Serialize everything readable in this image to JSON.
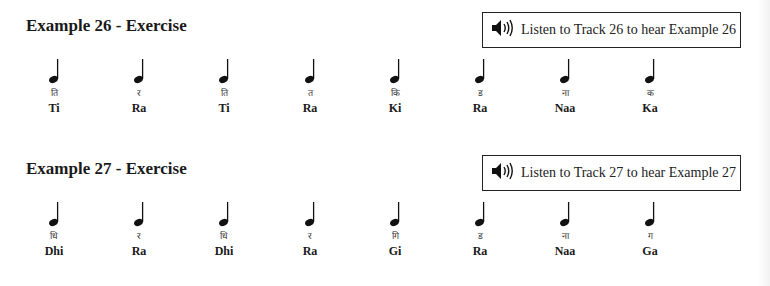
{
  "examples": [
    {
      "title": "Example 26 - Exercise",
      "track_text": "Listen to Track 26 to hear Example 26",
      "notes": [
        {
          "deva": "ति",
          "roman": "Ti"
        },
        {
          "deva": "र",
          "roman": "Ra"
        },
        {
          "deva": "ति",
          "roman": "Ti"
        },
        {
          "deva": "त",
          "roman": "Ra"
        },
        {
          "deva": "कि",
          "roman": "Ki"
        },
        {
          "deva": "ड",
          "roman": "Ra"
        },
        {
          "deva": "ना",
          "roman": "Naa"
        },
        {
          "deva": "क",
          "roman": "Ka"
        }
      ]
    },
    {
      "title": "Example 27 - Exercise",
      "track_text": "Listen to Track 27 to hear Example 27",
      "notes": [
        {
          "deva": "धि",
          "roman": "Dhi"
        },
        {
          "deva": "र",
          "roman": "Ra"
        },
        {
          "deva": "धि",
          "roman": "Dhi"
        },
        {
          "deva": "र",
          "roman": "Ra"
        },
        {
          "deva": "गि",
          "roman": "Gi"
        },
        {
          "deva": "ड",
          "roman": "Ra"
        },
        {
          "deva": "ना",
          "roman": "Naa"
        },
        {
          "deva": "ग",
          "roman": "Ga"
        }
      ]
    }
  ],
  "icons": {
    "speaker": "speaker-icon",
    "note": "quarter-note-icon"
  }
}
